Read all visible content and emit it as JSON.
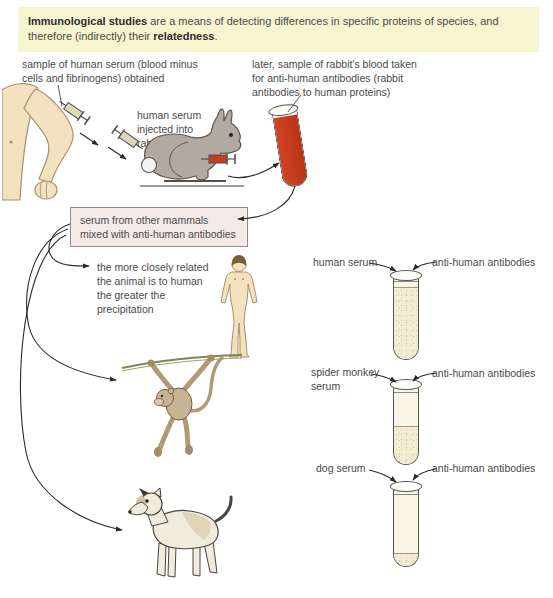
{
  "header": {
    "bold_lead": "Immunological studies",
    "mid": " are a means of detecting differences in specific proteins of species, and therefore (indirectly) their ",
    "bold_tail": "relatedness",
    "tail": "."
  },
  "annotations": {
    "serum_sample": "sample of human serum (blood minus\ncells and fibrinogens) obtained",
    "rabbit_blood": "later, sample of rabbit's blood taken\nfor anti-human antibodies (rabbit\nantibodies to human proteins)",
    "injection": "human serum\ninjected into\nrabbit",
    "mix_box": "serum from other mammals\nmixed with anti-human antibodies",
    "precipitation_note": "the more closely related\nthe animal is to human\nthe greater the\nprecipitation"
  },
  "tubes": [
    {
      "serum_label": "human serum",
      "antibody_label": "anti-human antibodies",
      "precipitate_pct": 85
    },
    {
      "serum_label": "spider monkey\nserum",
      "antibody_label": "anti-human antibodies",
      "precipitate_pct": 46
    },
    {
      "serum_label": "dog serum",
      "antibody_label": "anti-human antibodies",
      "precipitate_pct": 15
    }
  ],
  "illustrations": {
    "arm": "human-arm-with-syringe",
    "rabbit": "rabbit-being-injected",
    "blood_tube": "test-tube-of-rabbit-blood",
    "human": "standing-human-figure",
    "monkey": "spider-monkey-hanging-from-vine",
    "dog": "dog-standing"
  },
  "colors": {
    "header_bg": "#f7f5cf",
    "mix_box_bg": "#f6eae6",
    "blood_red": "#c73a1d",
    "precipitate": "#f2ecd2",
    "skin": "#f4e1bf",
    "rabbit_gray": "#b2a9a1"
  }
}
